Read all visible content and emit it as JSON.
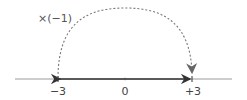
{
  "diagram": {
    "type": "number-line",
    "operation_label": "×(−1)",
    "axis_range": [
      -5,
      5
    ],
    "points": [
      {
        "value": -3,
        "label": "−3"
      },
      {
        "value": 0,
        "label": "0"
      },
      {
        "value": 3,
        "label": "+3"
      }
    ],
    "solid_arrow": {
      "from": 0,
      "to_left": -3,
      "to_right": 3
    },
    "dashed_arc": {
      "from": -3,
      "to": 3
    },
    "colors": {
      "axis": "#9a9a9a",
      "segment": "#333333",
      "arc": "#777777",
      "text": "#444444"
    }
  }
}
